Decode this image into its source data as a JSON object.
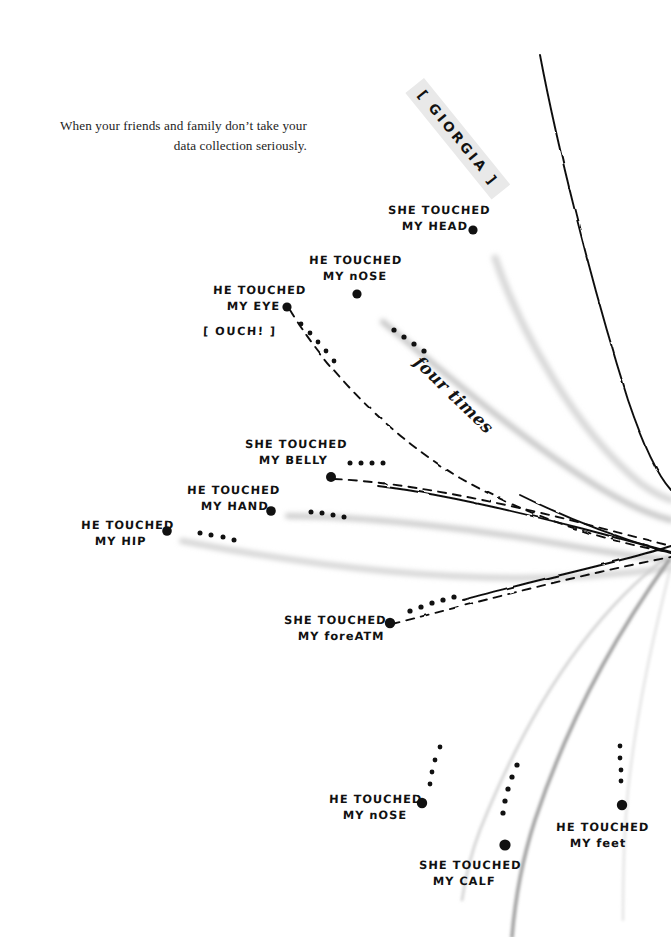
{
  "page": {
    "width": 671,
    "height": 937,
    "background": "#ffffff",
    "ink_color": "#111111",
    "caption_color": "#1d1d1d",
    "highlight_color": "#e9e9e9"
  },
  "caption": {
    "text": "When your friends and family don’t take your data collection seriously."
  },
  "author_tag": {
    "text": "[ GIORGIA ]",
    "rotation_deg": 51,
    "highlight": "#e9e9e9"
  },
  "annotations": {
    "four_times": "four times",
    "ouch": "[ OUCH! ]"
  },
  "labels": [
    {
      "id": "head",
      "line1": "SHE TOUCHED",
      "line2": "MY HEAD",
      "x": 388,
      "y": 203,
      "align": "left",
      "dot_x": 473,
      "dot_y": 230,
      "dot_r": 4.6
    },
    {
      "id": "nose1",
      "line1": "HE TOUCHED",
      "line2": "MY nOSE",
      "x": 309,
      "y": 253,
      "align": "left",
      "dot_x": 357,
      "dot_y": 294,
      "dot_r": 4.6
    },
    {
      "id": "eye",
      "line1": "HE TOUCHED",
      "line2": "MY EYE",
      "x": 213,
      "y": 283,
      "align": "left",
      "dot_x": 287,
      "dot_y": 307,
      "dot_r": 4.6
    },
    {
      "id": "belly",
      "line1": "SHE TOUCHED",
      "line2": "MY BELLY",
      "x": 245,
      "y": 437,
      "align": "left",
      "dot_x": 331,
      "dot_y": 477,
      "dot_r": 5.0
    },
    {
      "id": "hand",
      "line1": "HE TOUCHED",
      "line2": "MY  HAND",
      "x": 187,
      "y": 483,
      "align": "left",
      "dot_x": 271,
      "dot_y": 511,
      "dot_r": 4.8
    },
    {
      "id": "hip",
      "line1": "HE TOUCHED",
      "line2": "MY HIP",
      "x": 81,
      "y": 518,
      "align": "left",
      "dot_x": 167,
      "dot_y": 531,
      "dot_r": 4.8
    },
    {
      "id": "forearm",
      "line1": "SHE TOUCHED",
      "line2": "MY foreATM",
      "x": 284,
      "y": 613,
      "align": "left",
      "dot_x": 390,
      "dot_y": 623,
      "dot_r": 5.2
    },
    {
      "id": "nose2",
      "line1": "HE TOUCHED",
      "line2": "MY nOSE",
      "x": 329,
      "y": 792,
      "align": "left",
      "dot_x": 422,
      "dot_y": 803,
      "dot_r": 5.2
    },
    {
      "id": "calf",
      "line1": "SHE TOUCHED",
      "line2": "MY CALF",
      "x": 419,
      "y": 858,
      "align": "left",
      "dot_x": 505,
      "dot_y": 845,
      "dot_r": 5.6
    },
    {
      "id": "feet",
      "line1": "HE TOUCHED",
      "line2": "MY feet",
      "x": 556,
      "y": 820,
      "align": "left",
      "dot_x": 622,
      "dot_y": 805,
      "dot_r": 5.2
    }
  ],
  "chart_data": {
    "type": "scatter",
    "convergence_points": [
      {
        "x": 668,
        "y": 490
      },
      {
        "x": 665,
        "y": 545
      },
      {
        "x": 671,
        "y": 560
      }
    ],
    "events": [
      {
        "label": "SHE TOUCHED MY HEAD",
        "tally": 0,
        "line_style": "solid-black",
        "dot": [
          473,
          230
        ]
      },
      {
        "label": "HE TOUCHED MY nOSE",
        "tally": 4,
        "line_style": "gray",
        "dot": [
          357,
          294
        ]
      },
      {
        "label": "HE TOUCHED MY EYE",
        "tally": 5,
        "line_style": "dashed",
        "dot": [
          287,
          307
        ],
        "note": "[ OUCH! ]"
      },
      {
        "label": "SHE TOUCHED MY BELLY",
        "tally": 4,
        "line_style": "dashed",
        "dot": [
          331,
          477
        ]
      },
      {
        "label": "HE TOUCHED MY  HAND",
        "tally": 4,
        "line_style": "gray",
        "dot": [
          271,
          511
        ]
      },
      {
        "label": "HE TOUCHED MY HIP",
        "tally": 4,
        "line_style": "gray",
        "dot": [
          167,
          531
        ]
      },
      {
        "label": "SHE TOUCHED MY foreATM",
        "tally": 5,
        "line_style": "dashed",
        "dot": [
          390,
          623
        ]
      },
      {
        "label": "HE TOUCHED MY nOSE",
        "tally": 4,
        "line_style": "light-gray",
        "dot": [
          422,
          803
        ]
      },
      {
        "label": "SHE TOUCHED MY CALF",
        "tally": 5,
        "line_style": "medium-gray",
        "dot": [
          505,
          845
        ]
      },
      {
        "label": "HE TOUCHED MY feet",
        "tally": 4,
        "line_style": "faint-gray",
        "dot": [
          622,
          805
        ]
      }
    ],
    "annotation": {
      "text": "four times",
      "x": 424,
      "y": 352,
      "rotation_deg": 44
    },
    "xlabel": "",
    "ylabel": "",
    "grid": false,
    "legend": false
  }
}
